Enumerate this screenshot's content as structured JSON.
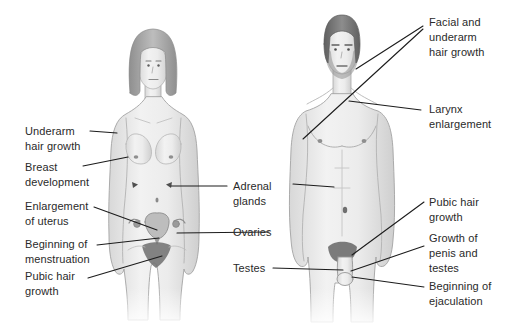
{
  "colors": {
    "background": "#ffffff",
    "label_text": "#2a2a2a",
    "leader_line": "#1c1c1c",
    "figure_outline": "#a3a3a3",
    "figure_fill_light": "#f1f1f1",
    "figure_fill_dark": "#d3d3d3",
    "hair_female": "#9a9a9a",
    "hair_male": "#6f6f6f"
  },
  "figures": [
    {
      "name": "female-figure"
    },
    {
      "name": "male-figure"
    }
  ],
  "labels": [
    {
      "id": "underarm-hair-growth-female",
      "text": "Underarm hair growth"
    },
    {
      "id": "breast-development",
      "text": "Breast development"
    },
    {
      "id": "enlargement-of-uterus",
      "text": "Enlargement of uterus"
    },
    {
      "id": "beginning-of-menstruation",
      "text": "Beginning of menstruation"
    },
    {
      "id": "pubic-hair-growth-female",
      "text": "Pubic hair growth"
    },
    {
      "id": "adrenal-glands",
      "text": "Adrenal glands"
    },
    {
      "id": "ovaries",
      "text": "Ovaries"
    },
    {
      "id": "testes",
      "text": "Testes"
    },
    {
      "id": "facial-and-underarm-hair-growth",
      "text": "Facial and underarm hair growth"
    },
    {
      "id": "larynx-enlargement",
      "text": "Larynx enlargement"
    },
    {
      "id": "pubic-hair-growth-male",
      "text": "Pubic hair growth"
    },
    {
      "id": "growth-of-penis-and-testes",
      "text": "Growth of penis and testes"
    },
    {
      "id": "beginning-of-ejaculation",
      "text": "Beginning of ejaculation"
    }
  ]
}
